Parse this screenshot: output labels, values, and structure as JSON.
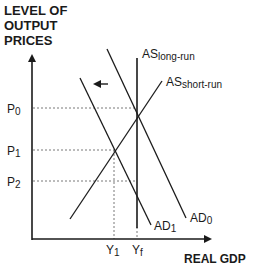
{
  "diagram": {
    "title_y_axis": [
      "LEVEL OF",
      "OUTPUT",
      "PRICES"
    ],
    "title_x_axis": "REAL GDP",
    "price_levels": [
      {
        "id": "P0",
        "base": "P",
        "sub": "0"
      },
      {
        "id": "P1",
        "base": "P",
        "sub": "1"
      },
      {
        "id": "P2",
        "base": "P",
        "sub": "2"
      }
    ],
    "output_levels": [
      {
        "id": "Y1",
        "base": "Y",
        "sub": "1"
      },
      {
        "id": "Yf",
        "base": "Y",
        "sub": "f"
      }
    ],
    "curves": {
      "as_long_run": {
        "base": "AS",
        "sub": "long-run"
      },
      "as_short_run": {
        "base": "AS",
        "sub": "short-run"
      },
      "ad0": {
        "base": "AD",
        "sub": "0"
      },
      "ad1": {
        "base": "AD",
        "sub": "1"
      }
    },
    "shift_arrow": "left",
    "colors": {
      "ink": "#1a1a1a",
      "guide": "#555555"
    }
  }
}
